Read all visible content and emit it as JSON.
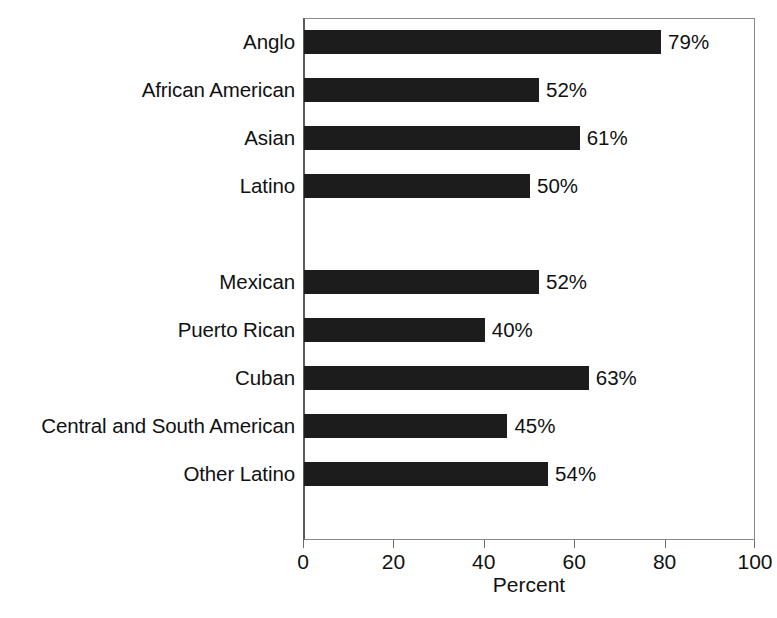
{
  "chart_data": {
    "type": "bar",
    "orientation": "horizontal",
    "title": "",
    "xlabel": "Percent",
    "ylabel": "",
    "xlim": [
      0,
      100
    ],
    "xticks": [
      0,
      20,
      40,
      60,
      80,
      100
    ],
    "xtick_labels": [
      "0",
      "20",
      "40",
      "60",
      "80",
      "100"
    ],
    "grid": false,
    "legend": null,
    "value_label_suffix": "%",
    "bar_color": "#1c1c1c",
    "categories": [
      "Anglo",
      "African American",
      "Asian",
      "Latino",
      "Mexican",
      "Puerto Rican",
      "Cuban",
      "Central and South American",
      "Other Latino"
    ],
    "values": [
      79,
      52,
      61,
      50,
      52,
      40,
      63,
      45,
      54
    ],
    "value_labels": [
      "79%",
      "52%",
      "61%",
      "50%",
      "52%",
      "40%",
      "63%",
      "45%",
      "54%"
    ],
    "group_break_after_index": 3,
    "rows": [
      {
        "label": "Anglo",
        "value": 79,
        "value_label": "79%",
        "spacer_after": false
      },
      {
        "label": "African American",
        "value": 52,
        "value_label": "52%",
        "spacer_after": false
      },
      {
        "label": "Asian",
        "value": 61,
        "value_label": "61%",
        "spacer_after": false
      },
      {
        "label": "Latino",
        "value": 50,
        "value_label": "50%",
        "spacer_after": true
      },
      {
        "label": "Mexican",
        "value": 52,
        "value_label": "52%",
        "spacer_after": false
      },
      {
        "label": "Puerto Rican",
        "value": 40,
        "value_label": "40%",
        "spacer_after": false
      },
      {
        "label": "Cuban",
        "value": 63,
        "value_label": "63%",
        "spacer_after": false
      },
      {
        "label": "Central and South American",
        "value": 45,
        "value_label": "45%",
        "spacer_after": false
      },
      {
        "label": "Other Latino",
        "value": 54,
        "value_label": "54%",
        "spacer_after": false
      }
    ]
  },
  "source_note": ""
}
